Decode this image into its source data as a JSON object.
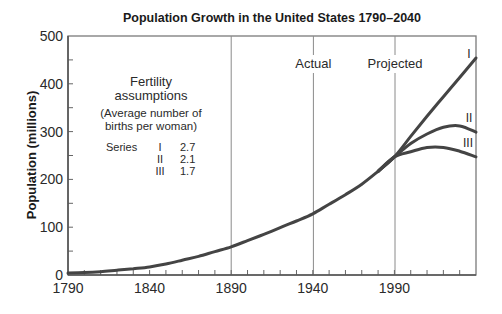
{
  "chart_data": {
    "type": "line",
    "title": "Population Growth in the United States 1790–2040",
    "xlabel": "",
    "ylabel": "Population (millions)",
    "xlim": [
      1790,
      2040
    ],
    "ylim": [
      0,
      500
    ],
    "x_ticks": [
      1790,
      1840,
      1890,
      1940,
      1990
    ],
    "x_tick_labels": [
      "1790",
      "1840",
      "1890",
      "1940",
      "1990"
    ],
    "x_minor_tick_step": 10,
    "y_ticks": [
      0,
      100,
      200,
      300,
      400,
      500
    ],
    "y_tick_labels": [
      "0",
      "100",
      "200",
      "300",
      "400",
      "500"
    ],
    "y_minor_tick_step": 50,
    "grid": false,
    "reference_lines": [
      {
        "x": 1890,
        "label": ""
      },
      {
        "x": 1940,
        "label": "Actual"
      },
      {
        "x": 1990,
        "label": "Projected"
      }
    ],
    "series": [
      {
        "name": "Actual",
        "x": [
          1790,
          1800,
          1810,
          1820,
          1830,
          1840,
          1850,
          1860,
          1870,
          1880,
          1890,
          1900,
          1910,
          1920,
          1930,
          1940,
          1950,
          1960,
          1970,
          1980,
          1990
        ],
        "values": [
          4,
          5,
          7,
          10,
          13,
          17,
          23,
          31,
          39,
          49,
          59,
          72,
          85,
          99,
          113,
          128,
          148,
          168,
          190,
          217,
          247
        ]
      },
      {
        "name": "I",
        "fertility": "2.7",
        "x": [
          1990,
          2000,
          2010,
          2020,
          2030,
          2040
        ],
        "values": [
          247,
          290,
          332,
          373,
          413,
          454
        ]
      },
      {
        "name": "II",
        "fertility": "2.1",
        "x": [
          1990,
          2000,
          2010,
          2020,
          2030,
          2040
        ],
        "values": [
          247,
          275,
          295,
          309,
          312,
          299
        ]
      },
      {
        "name": "III",
        "fertility": "1.7",
        "x": [
          1990,
          2000,
          2010,
          2020,
          2030,
          2040
        ],
        "values": [
          247,
          258,
          267,
          267,
          259,
          247
        ]
      }
    ],
    "annotations": {
      "legend_title": [
        "Fertility",
        "assumptions"
      ],
      "legend_subtitle": [
        "(Average number of",
        "births per woman)"
      ],
      "legend_rows": [
        {
          "prefix": "Series",
          "series": "I",
          "value": "2.7"
        },
        {
          "prefix": "",
          "series": "II",
          "value": "2.1"
        },
        {
          "prefix": "",
          "series": "III",
          "value": "1.7"
        }
      ],
      "series_end_labels": [
        "I",
        "II",
        "III"
      ]
    },
    "legend_position": "upper left (inside plot)"
  }
}
